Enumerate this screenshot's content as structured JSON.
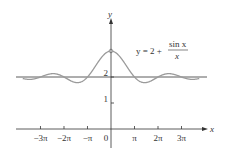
{
  "chart_data": {
    "type": "line",
    "title": "",
    "equation_label": {
      "lhs": "y = 2 + ",
      "num": "sin x",
      "den": "x"
    },
    "xlabel": "x",
    "ylabel": "y",
    "x_tick_labels": [
      "−3π",
      "−2π",
      "−π",
      "0",
      "π",
      "2π",
      "3π"
    ],
    "x_tick_values": [
      -9.4248,
      -6.2832,
      -3.1416,
      0,
      3.1416,
      6.2832,
      9.4248
    ],
    "y_tick_labels": [
      "1",
      "2"
    ],
    "y_tick_values": [
      1,
      2
    ],
    "xlim": [
      -11,
      11
    ],
    "ylim": [
      0,
      3.3
    ],
    "grid": false,
    "asymptote": {
      "y": 2
    },
    "hole": {
      "x": 0,
      "y": 3
    },
    "series": [
      {
        "name": "y = 2 + sin x / x",
        "function": "2 + sin(x)/x",
        "color": "#999999"
      }
    ]
  }
}
